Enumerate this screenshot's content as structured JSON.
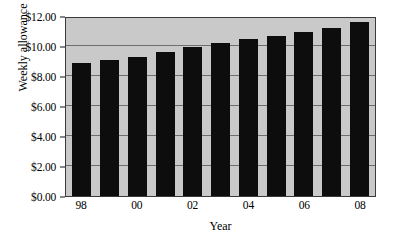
{
  "chart_data": {
    "type": "bar",
    "title": "",
    "xlabel": "Year",
    "ylabel": "Weekly allowance",
    "categories": [
      "98",
      "99",
      "00",
      "01",
      "02",
      "03",
      "04",
      "05",
      "06",
      "07",
      "08"
    ],
    "tick_labels_x": [
      "98",
      "",
      "00",
      "",
      "02",
      "",
      "04",
      "",
      "06",
      "",
      "08"
    ],
    "values": [
      8.9,
      9.1,
      9.3,
      9.6,
      9.95,
      10.2,
      10.5,
      10.7,
      10.95,
      11.2,
      11.6
    ],
    "ylim": [
      0,
      12
    ],
    "y_tick_values": [
      0,
      2,
      4,
      6,
      8,
      10,
      12
    ],
    "y_tick_labels": [
      "$0.00",
      "$2.00",
      "$4.00",
      "$6.00",
      "$8.00",
      "$10.00",
      "$12.00"
    ],
    "grid": true,
    "grid_axis": "y",
    "legend": "none",
    "colors": {
      "bar": "#0d0d0d",
      "plot_background": "#c9c9c9",
      "gridline": "#6e6e6e",
      "frame": "#3a3a3a",
      "text": "#000000",
      "page_background": "#ffffff"
    }
  }
}
